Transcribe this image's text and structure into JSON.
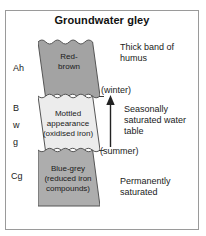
{
  "title": "Groundwater gley",
  "colors": {
    "frame_border": "#9a9a9a",
    "layer_top": "#a3a3a3",
    "layer_middle": "#ececec",
    "layer_bottom": "#adadad",
    "outline": "#555555",
    "text": "#1a1a1a",
    "arrow": "#222222"
  },
  "profile": {
    "layers": [
      {
        "id": "ah",
        "horizon_code": "Ah",
        "label": "Red-\nbrown",
        "label_line1": "Red-",
        "label_line2": "brown",
        "fill": "#a3a3a3"
      },
      {
        "id": "bwg",
        "horizon_code": "B w g",
        "horizon_code_lines": [
          "B",
          "w",
          "g"
        ],
        "label_line1": "Mottled",
        "label_line2": "appearance",
        "label_line3": "(oxidised iron)",
        "fill": "#ececec"
      },
      {
        "id": "cg",
        "horizon_code": "Cg",
        "label_line1": "Blue-grey",
        "label_line2": "(reduced iron",
        "label_line3": "compounds)",
        "fill": "#adadad"
      }
    ]
  },
  "annotations": {
    "humus": "Thick band of humus",
    "seasonal_water_table": "Seasonally saturated water table",
    "permanently_saturated": "Permanently saturated",
    "winter_level": "(winter)",
    "summer_level": "(summer)"
  }
}
